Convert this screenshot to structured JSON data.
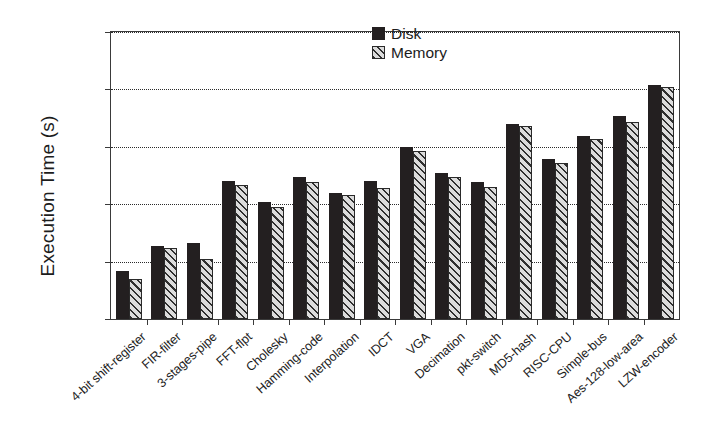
{
  "chart_data": {
    "type": "bar",
    "title": "",
    "xlabel": "",
    "ylabel": "Execution Time (s)",
    "yscale": "log",
    "ylim": [
      1,
      100000
    ],
    "ytick_labels": [
      "100000",
      "10000",
      "1000",
      "100",
      "10",
      "1"
    ],
    "ytick_values": [
      100000,
      10000,
      1000,
      100,
      10,
      1
    ],
    "grid": "horizontal-dotted",
    "legend_position": "top-right-inside",
    "categories": [
      "4-bit shift-register",
      "FIR-filter",
      "3-stages-pipe",
      "FFT-flpt",
      "Cholesky",
      "Hamming-code",
      "Interpolation",
      "IDCT",
      "VGA",
      "Decimation",
      "pkt-switch",
      "MD5-hash",
      "RISC-CPU",
      "Simple-bus",
      "Aes-128-low-area",
      "LZW-encoder"
    ],
    "series": [
      {
        "name": "Disk",
        "color": "#231f20",
        "pattern": "solid",
        "values": [
          7,
          19,
          21,
          250,
          110,
          300,
          155,
          250,
          1000,
          350,
          240,
          2500,
          620,
          1550,
          3400,
          12000
        ]
      },
      {
        "name": "Memory",
        "color": "#d9d9d9",
        "pattern": "diagonal-hatch",
        "values": [
          5,
          17,
          11,
          215,
          90,
          240,
          142,
          190,
          850,
          300,
          200,
          2300,
          530,
          1380,
          2750,
          11000
        ]
      }
    ]
  },
  "legend": {
    "entries": [
      {
        "label": "Disk",
        "swatch": "solid-black-square"
      },
      {
        "label": "Memory",
        "swatch": "hatched-square"
      }
    ]
  },
  "axes": {
    "y_title": "Execution Time (s)"
  }
}
